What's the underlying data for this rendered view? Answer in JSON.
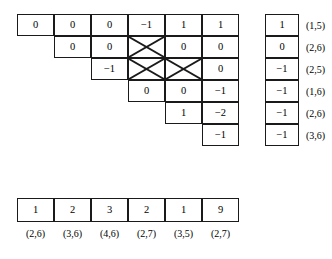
{
  "figure": {
    "kind": "matrix-diagram",
    "ink_color": "#1a1a1a",
    "background_color": "#ffffff"
  },
  "tri_matrix": {
    "name": "triangular-staircase-matrix",
    "rows": 6,
    "cols": 6,
    "cell_width": 37,
    "cell_height": 22,
    "rows_data": [
      {
        "start_col": 0,
        "cells": [
          {
            "value": "0",
            "crossed": false
          },
          {
            "value": "0",
            "crossed": false
          },
          {
            "value": "0",
            "crossed": false
          },
          {
            "value": "−1",
            "crossed": false
          },
          {
            "value": "1",
            "crossed": false
          },
          {
            "value": "1",
            "crossed": false
          }
        ]
      },
      {
        "start_col": 1,
        "cells": [
          {
            "value": "0",
            "crossed": false
          },
          {
            "value": "0",
            "crossed": false
          },
          {
            "value": "",
            "crossed": true
          },
          {
            "value": "0",
            "crossed": false
          },
          {
            "value": "0",
            "crossed": false
          }
        ]
      },
      {
        "start_col": 2,
        "cells": [
          {
            "value": "−1",
            "crossed": false
          },
          {
            "value": "",
            "crossed": true
          },
          {
            "value": "",
            "crossed": true
          },
          {
            "value": "0",
            "crossed": false
          }
        ]
      },
      {
        "start_col": 3,
        "cells": [
          {
            "value": "0",
            "crossed": false
          },
          {
            "value": "0",
            "crossed": false
          },
          {
            "value": "−1",
            "crossed": false
          }
        ]
      },
      {
        "start_col": 4,
        "cells": [
          {
            "value": "1",
            "crossed": false
          },
          {
            "value": "−2",
            "crossed": false
          }
        ]
      },
      {
        "start_col": 5,
        "cells": [
          {
            "value": "−1",
            "crossed": false
          }
        ]
      }
    ]
  },
  "right_column": {
    "name": "right-vector-column",
    "cell_width": 34,
    "cell_height": 22,
    "entries": [
      {
        "value": "1",
        "label": "(1,5)"
      },
      {
        "value": "0",
        "label": "(2,6)"
      },
      {
        "value": "−1",
        "label": "(2,5)"
      },
      {
        "value": "−1",
        "label": "(1,6)"
      },
      {
        "value": "−1",
        "label": "(2,6)"
      },
      {
        "value": "−1",
        "label": "(3,6)"
      }
    ]
  },
  "bottom_table": {
    "name": "bottom-row-table",
    "cell_width": 37,
    "cell_height": 24,
    "entries": [
      {
        "value": "1",
        "label": "(2,6)"
      },
      {
        "value": "2",
        "label": "(3,6)"
      },
      {
        "value": "3",
        "label": "(4,6)"
      },
      {
        "value": "2",
        "label": "(2,7)"
      },
      {
        "value": "1",
        "label": "(3,5)"
      },
      {
        "value": "9",
        "label": "(2,7)"
      }
    ]
  }
}
